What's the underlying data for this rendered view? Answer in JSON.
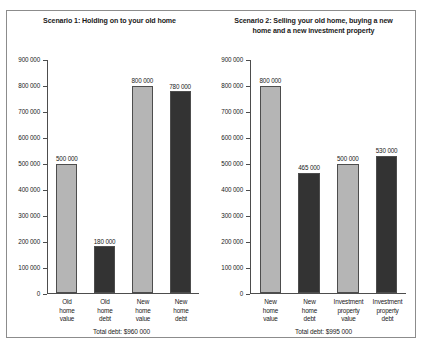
{
  "chart_data": [
    {
      "type": "bar",
      "title": "Scenario 1: Holding on to your old home",
      "categories": [
        "Old home value",
        "Old home debt",
        "New home value",
        "New home debt"
      ],
      "category_lines": [
        [
          "Old",
          "home",
          "value"
        ],
        [
          "Old",
          "home",
          "debt"
        ],
        [
          "New",
          "home",
          "value"
        ],
        [
          "New",
          "home",
          "debt"
        ]
      ],
      "values": [
        500000,
        180000,
        800000,
        780000
      ],
      "value_labels": [
        "500 000",
        "180 000",
        "800 000",
        "780 000"
      ],
      "bar_styles": [
        "light",
        "dark",
        "light",
        "dark"
      ],
      "xlabel": "",
      "ylabel": "",
      "ylim": [
        0,
        900000
      ],
      "ytick_values": [
        900000,
        800000,
        700000,
        600000,
        500000,
        400000,
        300000,
        200000,
        100000,
        0
      ],
      "ytick_labels": [
        "900 000",
        "800 000",
        "700 000",
        "600 000",
        "500 000",
        "400 000",
        "300 000",
        "200 000",
        "100 000",
        "0"
      ],
      "grid": false,
      "legend": null,
      "annotation": "Total debt: $960 000"
    },
    {
      "type": "bar",
      "title": "Scenario 2: Selling your old home, buying a new home and a new investment property",
      "categories": [
        "New home value",
        "New home debt",
        "Investment property value",
        "Investment property debt"
      ],
      "category_lines": [
        [
          "New",
          "home",
          "value"
        ],
        [
          "New",
          "home",
          "debt"
        ],
        [
          "Investment",
          "property",
          "value"
        ],
        [
          "Investment",
          "property",
          "debt"
        ]
      ],
      "values": [
        800000,
        465000,
        500000,
        530000
      ],
      "value_labels": [
        "800 000",
        "465 000",
        "500 000",
        "530 000"
      ],
      "bar_styles": [
        "light",
        "dark",
        "light",
        "dark"
      ],
      "xlabel": "",
      "ylabel": "",
      "ylim": [
        0,
        900000
      ],
      "ytick_values": [
        900000,
        800000,
        700000,
        600000,
        500000,
        400000,
        300000,
        200000,
        100000,
        0
      ],
      "ytick_labels": [
        "900 000",
        "800 000",
        "700 000",
        "600 000",
        "500 000",
        "400 000",
        "300 000",
        "200 000",
        "100 000",
        "0"
      ],
      "grid": false,
      "legend": null,
      "annotation": "Total debt: $995 000"
    }
  ],
  "panels": [
    {
      "title_lines": [
        "Scenario 1: Holding on to your old home"
      ],
      "annotation": "Total debt: $960 000"
    },
    {
      "title_lines": [
        "Scenario 2: Selling your old home, buying a new",
        "home and a new investment property"
      ],
      "annotation": "Total debt: $995 000"
    }
  ],
  "colors": {
    "bar_light": "#b5b5b5",
    "bar_dark": "#333333",
    "axis": "#4d4d4d",
    "border": "#8c8c8c",
    "text": "#1a1a1a",
    "background": "#ffffff"
  }
}
